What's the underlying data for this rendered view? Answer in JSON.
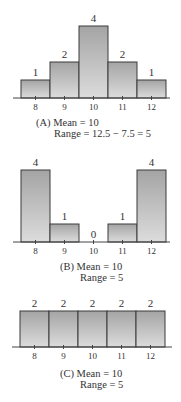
{
  "chart_data": [
    {
      "type": "bar",
      "panel": "A",
      "categories": [
        "8",
        "9",
        "10",
        "11",
        "12"
      ],
      "values": [
        1,
        2,
        4,
        2,
        1
      ],
      "data_labels": [
        "1",
        "2",
        "4",
        "2",
        "1"
      ],
      "caption": [
        "(A)  Mean = 10",
        "Range = 12.5 − 7.5 = 5"
      ],
      "xlabel": "",
      "ylabel": "",
      "ylim": [
        0,
        4
      ],
      "grid": false
    },
    {
      "type": "bar",
      "panel": "B",
      "categories": [
        "8",
        "9",
        "10",
        "11",
        "12"
      ],
      "values": [
        4,
        1,
        0,
        1,
        4
      ],
      "data_labels": [
        "4",
        "1",
        "0",
        "1",
        "4"
      ],
      "caption": [
        "(B)  Mean = 10",
        "Range = 5"
      ],
      "xlabel": "",
      "ylabel": "",
      "ylim": [
        0,
        4
      ],
      "grid": false
    },
    {
      "type": "bar",
      "panel": "C",
      "categories": [
        "8",
        "9",
        "10",
        "11",
        "12"
      ],
      "values": [
        2,
        2,
        2,
        2,
        2
      ],
      "data_labels": [
        "2",
        "2",
        "2",
        "2",
        "2"
      ],
      "caption": [
        "(C)  Mean = 10",
        "Range = 5"
      ],
      "xlabel": "",
      "ylabel": "",
      "ylim": [
        0,
        4
      ],
      "grid": false
    }
  ],
  "colors": {
    "bar_top": "#a4a4a4",
    "bar_bottom": "#dcdcdc",
    "bar_border": "#3a3a3a",
    "text": "#333333"
  }
}
